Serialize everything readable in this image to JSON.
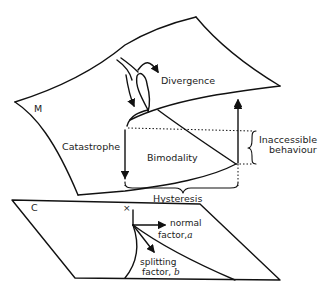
{
  "diagram": {
    "type": "cusp catastrophe surface",
    "labels": {
      "upper_surface": "M",
      "divergence": "Divergence",
      "catastrophe": "Catastrophe",
      "bimodality": "Bimodality",
      "inaccessible_line1": "Inaccessible",
      "inaccessible_line2": "behaviour",
      "hysteresis": "Hysteresis",
      "control_plane": "C",
      "origin": "×",
      "normal_line1": "normal",
      "normal_line2": "factor,",
      "normal_var": "a",
      "splitting_line1": "splitting",
      "splitting_line2": "factor,",
      "splitting_var": "b"
    },
    "colors": {
      "ink": "#111111",
      "paper": "#ffffff"
    }
  }
}
